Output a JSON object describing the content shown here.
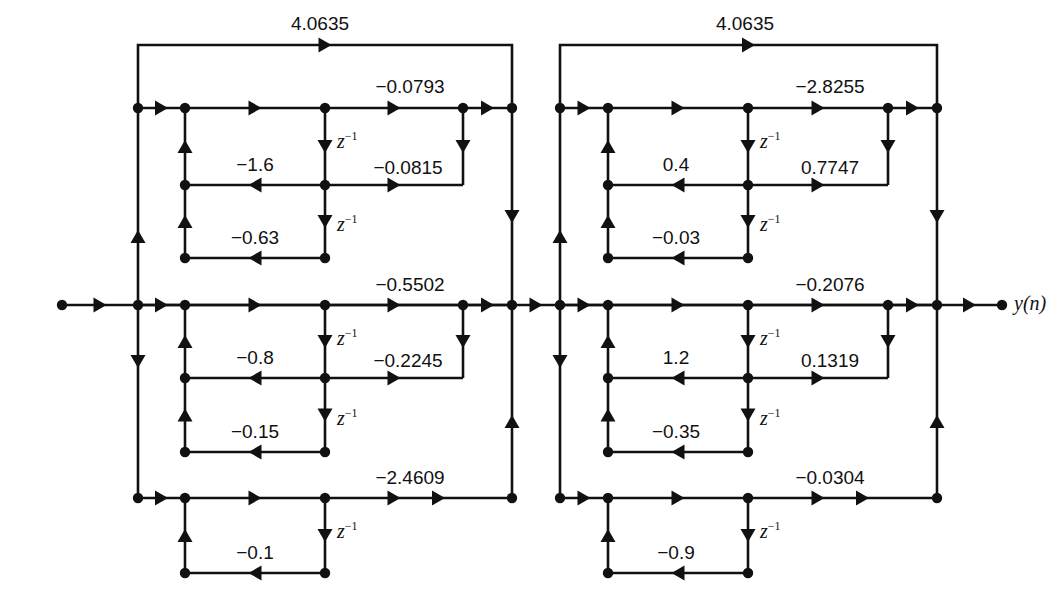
{
  "diagram": {
    "type": "signal-flow-graph",
    "io": {
      "input_label": "x(n)",
      "output_label": "y(n)",
      "input_dot_x": 62,
      "output_dot_x": 1002,
      "main_line_y": 305
    },
    "delay_label": "z",
    "delay_exponent": "−1",
    "stroke_color": "#111111",
    "sections": [
      {
        "name": "section-1",
        "bus_left_x": 138,
        "bus_right_x": 512,
        "node_col_x": 185,
        "tap_col_x": 325,
        "return_col_x": 463,
        "rows": {
          "top_rail_y": 45,
          "row_top_y": 108,
          "row_mid_y": 305,
          "row_bot_y": 498,
          "tap1_y": 185,
          "tap2_y": 258,
          "tap3_y": 378,
          "tap4_y": 452,
          "tap5_y": 573
        },
        "ladder_coefficients": [
          {
            "name": "top-rail-gain",
            "value": "4.0635",
            "x": 320,
            "y": 14
          },
          {
            "name": "ff-top-gain",
            "value": "−0.0793",
            "x": 410,
            "y": 77
          },
          {
            "name": "ff-mid-gain",
            "value": "−0.5502",
            "x": 410,
            "y": 275
          },
          {
            "name": "ff-bot-gain",
            "value": "−2.4609",
            "x": 410,
            "y": 468
          }
        ],
        "tap_coefficients": [
          {
            "name": "tap-gain-1",
            "value": "−0.0815",
            "x": 408,
            "y": 158
          },
          {
            "name": "tap-gain-2",
            "value": "−0.2245",
            "x": 408,
            "y": 351
          }
        ],
        "lattice_coefficients": [
          {
            "name": "lattice-k1",
            "value": "−1.6",
            "x": 255,
            "y": 155
          },
          {
            "name": "lattice-k2",
            "value": "−0.63",
            "x": 255,
            "y": 228
          },
          {
            "name": "lattice-k3",
            "value": "−0.8",
            "x": 255,
            "y": 348
          },
          {
            "name": "lattice-k4",
            "value": "−0.15",
            "x": 255,
            "y": 422
          },
          {
            "name": "lattice-k5",
            "value": "−0.1",
            "x": 255,
            "y": 543
          }
        ],
        "delay_marks": [
          {
            "name": "delay-1",
            "x": 337,
            "y": 130
          },
          {
            "name": "delay-2",
            "x": 337,
            "y": 213
          },
          {
            "name": "delay-3",
            "x": 337,
            "y": 327
          },
          {
            "name": "delay-4",
            "x": 337,
            "y": 407
          },
          {
            "name": "delay-5",
            "x": 337,
            "y": 520
          }
        ]
      },
      {
        "name": "section-2",
        "bus_left_x": 560,
        "bus_right_x": 937,
        "node_col_x": 608,
        "tap_col_x": 748,
        "return_col_x": 888,
        "rows": {
          "top_rail_y": 45,
          "row_top_y": 108,
          "row_mid_y": 305,
          "row_bot_y": 498,
          "tap1_y": 185,
          "tap2_y": 258,
          "tap3_y": 378,
          "tap4_y": 452,
          "tap5_y": 573
        },
        "ladder_coefficients": [
          {
            "name": "top-rail-gain",
            "value": "4.0635",
            "x": 745,
            "y": 14
          },
          {
            "name": "ff-top-gain",
            "value": "−2.8255",
            "x": 830,
            "y": 77
          },
          {
            "name": "ff-mid-gain",
            "value": "−0.2076",
            "x": 830,
            "y": 275
          },
          {
            "name": "ff-bot-gain",
            "value": "−0.0304",
            "x": 830,
            "y": 468
          }
        ],
        "tap_coefficients": [
          {
            "name": "tap-gain-1",
            "value": "0.7747",
            "x": 830,
            "y": 158
          },
          {
            "name": "tap-gain-2",
            "value": "0.1319",
            "x": 830,
            "y": 351
          }
        ],
        "lattice_coefficients": [
          {
            "name": "lattice-k1",
            "value": "0.4",
            "x": 676,
            "y": 155
          },
          {
            "name": "lattice-k2",
            "value": "−0.03",
            "x": 676,
            "y": 228
          },
          {
            "name": "lattice-k3",
            "value": "1.2",
            "x": 676,
            "y": 348
          },
          {
            "name": "lattice-k4",
            "value": "−0.35",
            "x": 676,
            "y": 422
          },
          {
            "name": "lattice-k5",
            "value": "−0.9",
            "x": 676,
            "y": 543
          }
        ],
        "delay_marks": [
          {
            "name": "delay-1",
            "x": 760,
            "y": 130
          },
          {
            "name": "delay-2",
            "x": 760,
            "y": 213
          },
          {
            "name": "delay-3",
            "x": 760,
            "y": 327
          },
          {
            "name": "delay-4",
            "x": 760,
            "y": 407
          },
          {
            "name": "delay-5",
            "x": 760,
            "y": 520
          }
        ]
      }
    ]
  }
}
